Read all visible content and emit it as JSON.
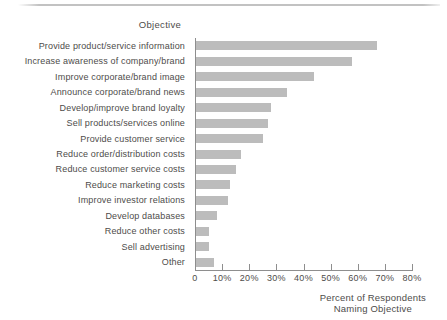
{
  "chart_data": {
    "type": "bar",
    "orientation": "horizontal",
    "title": "Objective",
    "categories": [
      "Provide product/service information",
      "Increase awareness of company/brand",
      "Improve corporate/brand image",
      "Announce corporate/brand news",
      "Develop/improve brand loyalty",
      "Sell products/services online",
      "Provide customer service",
      "Reduce order/distribution costs",
      "Reduce customer service costs",
      "Reduce marketing costs",
      "Improve investor relations",
      "Develop databases",
      "Reduce other costs",
      "Sell advertising",
      "Other"
    ],
    "values": [
      67,
      58,
      44,
      34,
      28,
      27,
      25,
      17,
      15,
      13,
      12,
      8,
      5,
      5,
      7
    ],
    "xlim": [
      0,
      80
    ],
    "x_tick_values": [
      0,
      10,
      20,
      30,
      40,
      50,
      60,
      70,
      80
    ],
    "x_tick_labels": [
      "0",
      "10%",
      "20%",
      "30%",
      "40%",
      "50%",
      "60%",
      "70%",
      "80%"
    ],
    "xlabel_lines": [
      "Percent of Respondents",
      "Naming Objective"
    ],
    "grid": false,
    "legend": "none",
    "bar_color": "#bcbcbc",
    "axis_color": "#8e8e8e",
    "text_color": "#4e4c4a"
  }
}
